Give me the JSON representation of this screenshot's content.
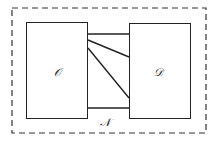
{
  "diagram": {
    "outer_region": {
      "label": "𝒩",
      "style": "dashed"
    },
    "left_box": {
      "label": "𝒪"
    },
    "right_box": {
      "label": "𝒟"
    },
    "connections": [
      {
        "from_y": 34,
        "to_y": 34
      },
      {
        "from_y": 40,
        "to_y": 57
      },
      {
        "from_y": 48,
        "to_y": 98
      },
      {
        "from_y": 108,
        "to_y": 108
      }
    ],
    "colors": {
      "stroke": "#222222",
      "background": "#ffffff"
    }
  }
}
